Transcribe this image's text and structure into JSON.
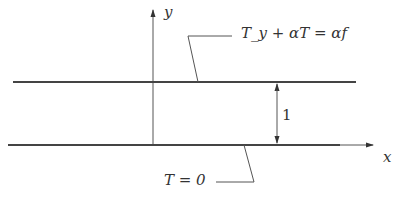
{
  "diagram": {
    "axes": {
      "x_label": "x",
      "y_label": "y"
    },
    "top_boundary": {
      "condition": "T_y + αT = αf"
    },
    "bottom_boundary": {
      "condition": "T = 0"
    },
    "width_label": "1",
    "colors": {
      "line": "#444444",
      "thin_line": "#555555",
      "text": "#333333"
    }
  }
}
